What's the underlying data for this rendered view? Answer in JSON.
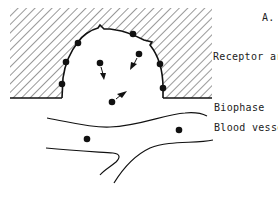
{
  "figure": {
    "panel_label": "A.",
    "labels": {
      "receptor_area": "Receptor area",
      "biophase": "Biophase",
      "blood_vessel": "Blood vessel"
    },
    "colors": {
      "ink": "#111111",
      "background": "#ffffff"
    }
  }
}
